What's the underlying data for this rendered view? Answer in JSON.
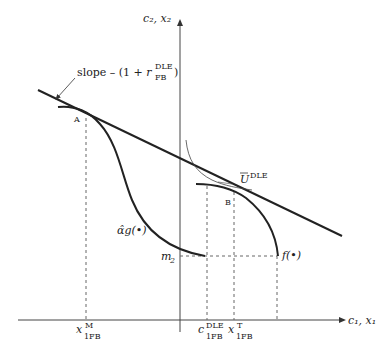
{
  "diagram": {
    "axes": {
      "y_label": "c₂, x₂",
      "x_label": "c₁, x₁"
    },
    "tangent_line": {
      "label_prefix": "slope – (1 + ",
      "label_var": "r",
      "label_sup": "DLE",
      "label_sub": "FB",
      "label_suffix": ")"
    },
    "points": {
      "A": "A",
      "B": "B"
    },
    "curves": {
      "g_curve_label": "α̂g(•)",
      "f_curve_label": "f(•)",
      "indifference_label": "U",
      "indifference_sup": "DLE"
    },
    "ticks": {
      "m2_main": "m",
      "m2_sub": "2",
      "x_M_main": "x",
      "x_M_sup": "M",
      "x_M_sub": "1FB",
      "c_DLE_main": "c",
      "c_DLE_sup": "DLE",
      "c_DLE_sub": "1FB",
      "x_T_main": "x",
      "x_T_sup": "T",
      "x_T_sub": "1FB"
    },
    "colors": {
      "stroke": "#222222",
      "axis": "#444444",
      "dashed": "#666666"
    }
  }
}
